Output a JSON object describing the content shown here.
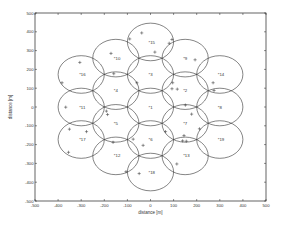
{
  "chart_data": {
    "type": "scatter",
    "title": "",
    "xlabel": "distance [m]",
    "ylabel": "distance [m]",
    "xlim": [
      -500,
      500
    ],
    "ylim": [
      -500,
      500
    ],
    "grid": false,
    "legend": null,
    "x_ticks": [
      -500,
      -400,
      -300,
      -200,
      -100,
      0,
      100,
      200,
      300,
      400,
      500
    ],
    "y_ticks": [
      500,
      400,
      300,
      200,
      100,
      0,
      -100,
      -200,
      -300,
      -400,
      -500
    ],
    "cell_radius": 100,
    "cells": [
      {
        "id": 1,
        "x": 0,
        "y": 0
      },
      {
        "id": 2,
        "x": 150,
        "y": 87
      },
      {
        "id": 3,
        "x": 0,
        "y": 173
      },
      {
        "id": 4,
        "x": -150,
        "y": 87
      },
      {
        "id": 5,
        "x": -150,
        "y": -87
      },
      {
        "id": 6,
        "x": 0,
        "y": -173
      },
      {
        "id": 7,
        "x": 150,
        "y": -87
      },
      {
        "id": 8,
        "x": 300,
        "y": 0
      },
      {
        "id": 9,
        "x": 150,
        "y": 260
      },
      {
        "id": 10,
        "x": -150,
        "y": 260
      },
      {
        "id": 11,
        "x": -300,
        "y": 0
      },
      {
        "id": 12,
        "x": -150,
        "y": -260
      },
      {
        "id": 13,
        "x": 150,
        "y": -260
      },
      {
        "id": 14,
        "x": 300,
        "y": 173
      },
      {
        "id": 15,
        "x": 0,
        "y": 346
      },
      {
        "id": 16,
        "x": -300,
        "y": 173
      },
      {
        "id": 17,
        "x": -300,
        "y": -173
      },
      {
        "id": 18,
        "x": 0,
        "y": -346
      },
      {
        "id": 19,
        "x": 300,
        "y": -173
      }
    ],
    "users": [
      [
        -38,
        394
      ],
      [
        -90,
        362
      ],
      [
        93,
        359
      ],
      [
        81,
        339
      ],
      [
        19,
        292
      ],
      [
        -171,
        285
      ],
      [
        193,
        251
      ],
      [
        -306,
        237
      ],
      [
        -159,
        177
      ],
      [
        -383,
        129
      ],
      [
        -59,
        129
      ],
      [
        96,
        129
      ],
      [
        271,
        129
      ],
      [
        93,
        97
      ],
      [
        116,
        95
      ],
      [
        275,
        88
      ],
      [
        -367,
        -1
      ],
      [
        151,
        10
      ],
      [
        -191,
        -22
      ],
      [
        -186,
        -40
      ],
      [
        178,
        -38
      ],
      [
        -351,
        -118
      ],
      [
        -277,
        -131
      ],
      [
        212,
        -116
      ],
      [
        65,
        -131
      ],
      [
        -75,
        -171
      ],
      [
        145,
        -152
      ],
      [
        139,
        -180
      ],
      [
        155,
        -182
      ],
      [
        -162,
        -188
      ],
      [
        -32,
        -204
      ],
      [
        -355,
        -241
      ],
      [
        114,
        -303
      ],
      [
        -106,
        -344
      ],
      [
        -49,
        -354
      ]
    ]
  }
}
